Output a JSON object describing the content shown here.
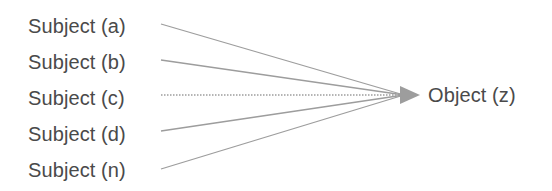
{
  "diagram": {
    "type": "convergence-arrow-diagram",
    "background_color": "#ffffff",
    "text_color": "#4a4a4a",
    "line_color": "#9d9d9d",
    "arrow_color": "#9d9d9d",
    "convergence_point": {
      "x": 404,
      "y": 95
    },
    "subjects": [
      {
        "label": "Subject (a)",
        "label_top": 16,
        "line_start": {
          "x": 161,
          "y": 24
        },
        "style": "solid"
      },
      {
        "label": "Subject (b)",
        "label_top": 52,
        "line_start": {
          "x": 161,
          "y": 60
        },
        "style": "solid"
      },
      {
        "label": "Subject (c)",
        "label_top": 88,
        "line_start": {
          "x": 161,
          "y": 95
        },
        "style": "dotted"
      },
      {
        "label": "Subject (d)",
        "label_top": 124,
        "line_start": {
          "x": 161,
          "y": 131
        },
        "style": "solid"
      },
      {
        "label": "Subject (n)",
        "label_top": 160,
        "line_start": {
          "x": 161,
          "y": 169
        },
        "style": "solid"
      }
    ],
    "object": {
      "label": "Object (z)"
    },
    "arrowhead": {
      "tip_x": 420,
      "base_x": 400,
      "half_height": 9,
      "center_y": 95
    }
  }
}
